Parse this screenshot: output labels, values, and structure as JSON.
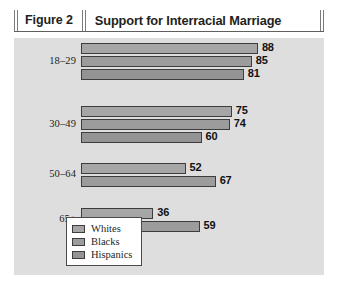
{
  "header": {
    "figure_label": "Figure 2",
    "title": "Support for Interracial Marriage"
  },
  "legend": {
    "items": [
      {
        "label": "Whites",
        "color": "#a6a6a6"
      },
      {
        "label": "Blacks",
        "color": "#9c9c9c"
      },
      {
        "label": "Hispanics",
        "color": "#949494"
      }
    ]
  },
  "chart_data": {
    "type": "bar",
    "orientation": "horizontal",
    "title": "Support for Interracial Marriage",
    "xlabel": "",
    "ylabel": "",
    "xlim": [
      0,
      100
    ],
    "grid": false,
    "legend_position": "inside-bottom-left",
    "categories": [
      "18–29",
      "30–49",
      "50–64",
      "65+"
    ],
    "series": [
      {
        "name": "Whites",
        "values": [
          88,
          75,
          52,
          36
        ]
      },
      {
        "name": "Blacks",
        "values": [
          85,
          74,
          67,
          59
        ]
      },
      {
        "name": "Hispanics",
        "values": [
          81,
          60,
          null,
          null
        ]
      }
    ],
    "groups": [
      {
        "category": "18–29",
        "bars": [
          {
            "series": "Whites",
            "value": 88,
            "label": "88"
          },
          {
            "series": "Blacks",
            "value": 85,
            "label": "85"
          },
          {
            "series": "Hispanics",
            "value": 81,
            "label": "81"
          }
        ]
      },
      {
        "category": "30–49",
        "bars": [
          {
            "series": "Whites",
            "value": 75,
            "label": "75"
          },
          {
            "series": "Blacks",
            "value": 74,
            "label": "74"
          },
          {
            "series": "Hispanics",
            "value": 60,
            "label": "60"
          }
        ]
      },
      {
        "category": "50–64",
        "bars": [
          {
            "series": "Whites",
            "value": 52,
            "label": "52"
          },
          {
            "series": "Blacks",
            "value": 67,
            "label": "67"
          }
        ]
      },
      {
        "category": "65+",
        "bars": [
          {
            "series": "Whites",
            "value": 36,
            "label": "36"
          },
          {
            "series": "Blacks",
            "value": 59,
            "label": "59"
          }
        ]
      }
    ]
  }
}
